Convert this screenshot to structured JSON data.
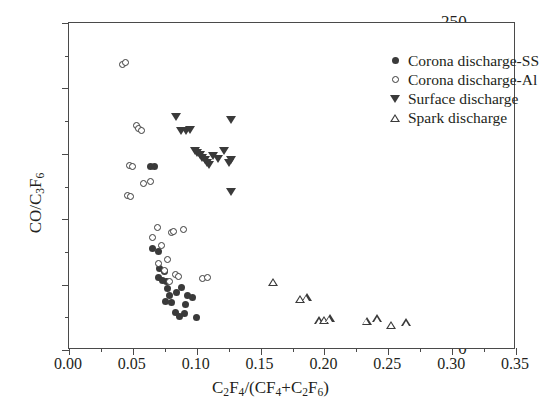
{
  "chart_data": {
    "type": "scatter",
    "title": "",
    "xlabel": "C2F4/(CF4+C2F6)",
    "ylabel": "CO/C3F6",
    "xlim": [
      0.0,
      0.35
    ],
    "ylim": [
      0,
      250
    ],
    "xticks": [
      "0.00",
      "0.05",
      "0.10",
      "0.15",
      "0.20",
      "0.25",
      "0.30",
      "0.35"
    ],
    "xtick_values": [
      0.0,
      0.05,
      0.1,
      0.15,
      0.2,
      0.25,
      0.3,
      0.35
    ],
    "yticks": [
      "0",
      "50",
      "100",
      "150",
      "200",
      "250"
    ],
    "ytick_values": [
      0,
      50,
      100,
      150,
      200,
      250
    ],
    "grid": false,
    "legend_position": "top-right",
    "series": [
      {
        "name": "Corona discharge-SS",
        "marker": "filled-circle",
        "color": "#3a3a3a",
        "points": [
          [
            0.0655,
            77.5
          ],
          [
            0.07,
            75.0
          ],
          [
            0.0712,
            62.0
          ],
          [
            0.0745,
            60.0
          ],
          [
            0.064,
            140.0
          ],
          [
            0.0668,
            140.5
          ],
          [
            0.076,
            52.0
          ],
          [
            0.0775,
            47.0
          ],
          [
            0.079,
            42.0
          ],
          [
            0.08,
            36.5
          ],
          [
            0.0758,
            37.0
          ],
          [
            0.083,
            29.0
          ],
          [
            0.0862,
            25.5
          ],
          [
            0.0905,
            28.0
          ],
          [
            0.093,
            42.0
          ],
          [
            0.0965,
            40.0
          ],
          [
            0.0995,
            25.0
          ],
          [
            0.088,
            48.0
          ],
          [
            0.091,
            34.5
          ],
          [
            0.084,
            44.0
          ],
          [
            0.07,
            55.5
          ],
          [
            0.0735,
            53.0
          ]
        ]
      },
      {
        "name": "Corona discharge-Al",
        "marker": "open-circle",
        "color": "#3a3a3a",
        "points": [
          [
            0.0415,
            218.0
          ],
          [
            0.0445,
            219.5
          ],
          [
            0.0525,
            172.0
          ],
          [
            0.0545,
            169.5
          ],
          [
            0.057,
            167.5
          ],
          [
            0.047,
            141.0
          ],
          [
            0.0495,
            140.0
          ],
          [
            0.0585,
            127.0
          ],
          [
            0.064,
            128.5
          ],
          [
            0.0455,
            118.0
          ],
          [
            0.0478,
            117.0
          ],
          [
            0.069,
            94.0
          ],
          [
            0.08,
            90.0
          ],
          [
            0.0822,
            90.5
          ],
          [
            0.09,
            92.0
          ],
          [
            0.0725,
            80.0
          ],
          [
            0.0775,
            69.0
          ],
          [
            0.0745,
            60.5
          ],
          [
            0.0835,
            57.5
          ],
          [
            0.0858,
            56.5
          ],
          [
            0.079,
            52.0
          ],
          [
            0.1045,
            55.0
          ],
          [
            0.1085,
            55.5
          ],
          [
            0.065,
            86.0
          ],
          [
            0.07,
            66.0
          ]
        ]
      },
      {
        "name": "Surface discharge",
        "marker": "filled-triangle-down",
        "color": "#3a3a3a",
        "points": [
          [
            0.084,
            178.0
          ],
          [
            0.1265,
            176.0
          ],
          [
            0.088,
            167.0
          ],
          [
            0.0915,
            167.5
          ],
          [
            0.095,
            168.0
          ],
          [
            0.0985,
            152.0
          ],
          [
            0.1005,
            150.5
          ],
          [
            0.1025,
            149.0
          ],
          [
            0.1045,
            147.0
          ],
          [
            0.1062,
            145.0
          ],
          [
            0.108,
            143.0
          ],
          [
            0.11,
            141.5
          ],
          [
            0.113,
            148.0
          ],
          [
            0.1168,
            146.0
          ],
          [
            0.121,
            152.0
          ],
          [
            0.1268,
            145.0
          ],
          [
            0.125,
            143.0
          ],
          [
            0.1265,
            120.5
          ]
        ]
      },
      {
        "name": "Spark discharge",
        "marker": "open-triangle-up",
        "color": "#3a3a3a",
        "points": [
          [
            0.16,
            52.0
          ],
          [
            0.181,
            39.0
          ],
          [
            0.186,
            40.0
          ],
          [
            0.196,
            22.5
          ],
          [
            0.1995,
            23.0
          ],
          [
            0.204,
            24.0
          ],
          [
            0.233,
            22.0
          ],
          [
            0.241,
            24.0
          ],
          [
            0.252,
            19.0
          ],
          [
            0.264,
            21.0
          ]
        ]
      }
    ]
  },
  "axes": {
    "y_title_parts": {
      "pre": "CO/C",
      "sub1": "3",
      "mid": "F",
      "sub2": "6"
    },
    "x_title_parts": {
      "a": "C",
      "a_sub": "2",
      "b": "F",
      "b_sub": "4",
      "slash": "/(CF",
      "c_sub": "4",
      "plus": "+C",
      "d_sub": "2",
      "d": "F",
      "e_sub": "6",
      "close": ")"
    }
  },
  "legend": {
    "entries": [
      {
        "label": "Corona discharge-SS",
        "marker": "filled-circle"
      },
      {
        "label": "Corona discharge-Al",
        "marker": "open-circle"
      },
      {
        "label": "Surface discharge",
        "marker": "filled-triangle-down"
      },
      {
        "label": "Spark discharge",
        "marker": "open-triangle-up"
      }
    ]
  }
}
